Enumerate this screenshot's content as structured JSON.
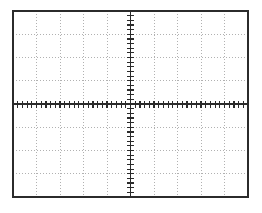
{
  "figure": {
    "kind": "oscilloscope-graticule",
    "title": "",
    "background_color": "#ffffff"
  },
  "graticule": {
    "frame": {
      "x": 13,
      "y": 11,
      "width": 235,
      "height": 186,
      "stroke_color": "#2b2b2b",
      "stroke_width": 1.6
    },
    "divisions": {
      "horizontal": 10,
      "vertical": 8
    },
    "gridlines": {
      "stroke_color": "#a8a8a8",
      "stroke_width": 0.9,
      "dash_pattern": "1.4 1.6",
      "style": "dotted"
    },
    "center_axes": {
      "stroke_color": "#2b2b2b",
      "stroke_width": 1.3,
      "x_center": 130.5,
      "y_center": 104.0
    },
    "minor_ticks": {
      "per_division": 5,
      "tick_length": 7,
      "stroke_color": "#2b2b2b",
      "stroke_width": 1.2
    }
  },
  "chart_data": {
    "type": "line",
    "title": "",
    "subtitle": "",
    "xlabel": "",
    "ylabel": "",
    "x": [],
    "values": [],
    "series": [],
    "categories": [],
    "xlim": [
      -5,
      5
    ],
    "ylim": [
      -4,
      4
    ],
    "x_divisions": 10,
    "y_divisions": 8,
    "x_tick_labels": [],
    "y_tick_labels": [],
    "grid": true,
    "legend": null,
    "legend_position": "none",
    "annotations": []
  }
}
